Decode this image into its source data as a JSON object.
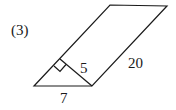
{
  "problem_label": "(3)",
  "figure": {
    "type": "parallelogram-with-altitude",
    "labels": {
      "altitude": "5",
      "side": "20",
      "base": "7"
    },
    "vertices": {
      "bottom_left": [
        34,
        86
      ],
      "bottom_right": [
        92,
        86
      ],
      "top_right": [
        167,
        6
      ],
      "top_left": [
        110,
        5
      ],
      "altitude_foot": [
        60,
        60
      ]
    },
    "right_angle_marker": true,
    "line_color": "#1a1a1a"
  }
}
